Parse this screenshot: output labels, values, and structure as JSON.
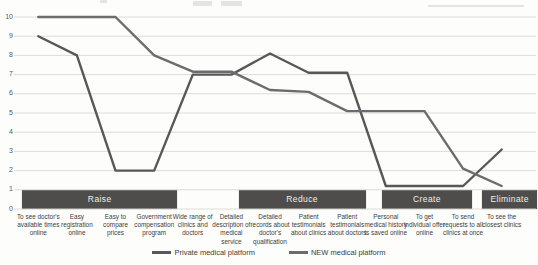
{
  "chart_data": {
    "type": "line",
    "categories": [
      "To see doctor's available times online",
      "Easy registration online",
      "Easy to compare prices",
      "Government compensation program",
      "Wide range of clinics and doctors",
      "Detailed description of medical service",
      "Detailed records about doctor's qualification",
      "Patient testimonials about clinics",
      "Patient testimonials about doctors",
      "Personal medical history is saved online",
      "To get individual offer online",
      "To send requests to all clinics at once",
      "To see the closest clinics"
    ],
    "series": [
      {
        "name": "Private medical platform",
        "color": "#58585a",
        "values": [
          9,
          8,
          2,
          2,
          7,
          7,
          8.1,
          7.1,
          7.1,
          1.2,
          1.2,
          1.2,
          3.1
        ]
      },
      {
        "name": "NEW medical platform",
        "color": "#6c6c6e",
        "values": [
          10,
          10,
          10,
          8,
          7.15,
          7.15,
          6.2,
          6.1,
          5.1,
          5.1,
          5.1,
          2.1,
          1.2
        ]
      }
    ],
    "ylim": [
      0,
      10
    ],
    "yticks": [
      0,
      1,
      2,
      3,
      4,
      5,
      6,
      7,
      8,
      9,
      10
    ],
    "grid": true,
    "legend_position": "bottom",
    "bands": [
      {
        "label": "Raise",
        "from_category": 1,
        "to_category": 4
      },
      {
        "label": "Reduce",
        "from_category": 7,
        "to_category": 9
      },
      {
        "label": "Create",
        "from_category": 10,
        "to_category": 12
      },
      {
        "label": "Eliminate",
        "from_category": 13,
        "to_category": 13
      }
    ],
    "band_color": "#4e4d4b",
    "band_text_color": "#efeeec",
    "gridline_color": "#d8d8d5",
    "axis_text_color": "#595959"
  }
}
